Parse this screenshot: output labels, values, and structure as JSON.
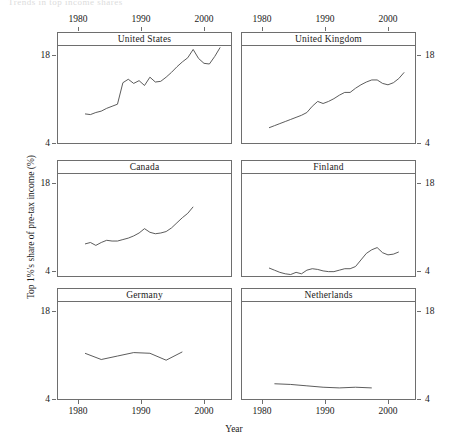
{
  "page": {
    "header_fragment": "Trends in top income shares"
  },
  "chart_data": {
    "type": "line",
    "title": "",
    "xlabel": "Year",
    "ylabel": "Top 1%'s share of pre-tax income (%)",
    "xlim": [
      1975,
      2007
    ],
    "ylim": [
      4,
      18
    ],
    "xticks": [
      1980,
      1990,
      2000
    ],
    "xticklabels": [
      "1980",
      "1990",
      "2000"
    ],
    "yticks": [
      4,
      18
    ],
    "yticklabels": [
      "4",
      "18"
    ],
    "grid": false,
    "legend": "none",
    "layout": "trellis 3 rows x 2 columns, strip labels on top of each panel",
    "axis_ticks_position": "x-axis labelled on top row and bottom row; y-axis labelled on both left and right",
    "panels": [
      {
        "name": "United States",
        "row": 1,
        "col": 1,
        "x": [
          1980,
          1981,
          1982,
          1983,
          1984,
          1985,
          1986,
          1987,
          1988,
          1989,
          1990,
          1991,
          1992,
          1993,
          1994,
          1995,
          1996,
          1997,
          1998,
          1999,
          2000,
          2001,
          2002,
          2003,
          2004,
          2005
        ],
        "y": [
          8.2,
          8.1,
          8.4,
          8.6,
          9.0,
          9.3,
          9.6,
          12.7,
          13.2,
          12.6,
          13.0,
          12.3,
          13.5,
          12.8,
          12.9,
          13.5,
          14.2,
          15.0,
          15.7,
          16.3,
          17.5,
          16.2,
          15.5,
          15.4,
          16.5,
          17.8
        ]
      },
      {
        "name": "United Kingdom",
        "row": 1,
        "col": 2,
        "x": [
          1980,
          1981,
          1982,
          1983,
          1984,
          1985,
          1986,
          1987,
          1988,
          1989,
          1990,
          1991,
          1992,
          1993,
          1994,
          1995,
          1996,
          1997,
          1998,
          1999,
          2000,
          2001,
          2002,
          2003,
          2004,
          2005
        ],
        "y": [
          6.2,
          6.5,
          6.8,
          7.1,
          7.4,
          7.7,
          8.0,
          8.4,
          9.3,
          10.0,
          9.7,
          10.0,
          10.4,
          10.9,
          11.3,
          11.3,
          11.9,
          12.4,
          12.8,
          13.1,
          13.1,
          12.6,
          12.4,
          12.7,
          13.3,
          14.2
        ]
      },
      {
        "name": "Canada",
        "row": 2,
        "col": 1,
        "x": [
          1980,
          1981,
          1982,
          1983,
          1984,
          1985,
          1986,
          1987,
          1988,
          1989,
          1990,
          1991,
          1992,
          1993,
          1994,
          1995,
          1996,
          1997,
          1998,
          1999,
          2000
        ],
        "y": [
          8.4,
          8.6,
          8.2,
          8.6,
          8.9,
          8.8,
          8.8,
          9.0,
          9.2,
          9.5,
          9.9,
          10.5,
          10.0,
          9.8,
          9.9,
          10.1,
          10.6,
          11.3,
          12.0,
          12.6,
          13.5
        ]
      },
      {
        "name": "Finland",
        "row": 2,
        "col": 2,
        "x": [
          1980,
          1981,
          1982,
          1983,
          1984,
          1985,
          1986,
          1987,
          1988,
          1989,
          1990,
          1991,
          1992,
          1993,
          1994,
          1995,
          1996,
          1997,
          1998,
          1999,
          2000,
          2001,
          2002,
          2003,
          2004
        ],
        "y": [
          5.1,
          4.8,
          4.5,
          4.3,
          4.2,
          4.5,
          4.3,
          4.8,
          5.0,
          4.9,
          4.7,
          4.6,
          4.6,
          4.8,
          5.0,
          5.0,
          5.3,
          6.2,
          7.1,
          7.6,
          7.9,
          7.2,
          6.9,
          7.0,
          7.3
        ]
      },
      {
        "name": "Germany",
        "row": 3,
        "col": 1,
        "x": [
          1980,
          1983,
          1986,
          1989,
          1992,
          1995,
          1998
        ],
        "y": [
          10.6,
          9.7,
          10.2,
          10.7,
          10.6,
          9.6,
          10.8
        ]
      },
      {
        "name": "Netherlands",
        "row": 3,
        "col": 2,
        "x": [
          1981,
          1984,
          1987,
          1990,
          1993,
          1996,
          1999
        ],
        "y": [
          6.2,
          6.1,
          5.9,
          5.7,
          5.6,
          5.7,
          5.6
        ]
      }
    ]
  },
  "axis_text": {
    "x_top_left": [
      "1980",
      "1990",
      "2000"
    ],
    "x_top_right": [
      "1980",
      "1990",
      "2000"
    ],
    "x_bottom_left": [
      "1980",
      "1990",
      "2000"
    ],
    "x_bottom_right": [
      "1980",
      "1990",
      "2000"
    ],
    "y_left_top": "18",
    "y_left_bottom": "4",
    "y_right_top": "18",
    "y_right_bottom": "4"
  },
  "colors": {
    "line": "#4a4a4a",
    "frame": "#6e6e6e",
    "text": "#1a1a1a",
    "background": "#ffffff"
  }
}
